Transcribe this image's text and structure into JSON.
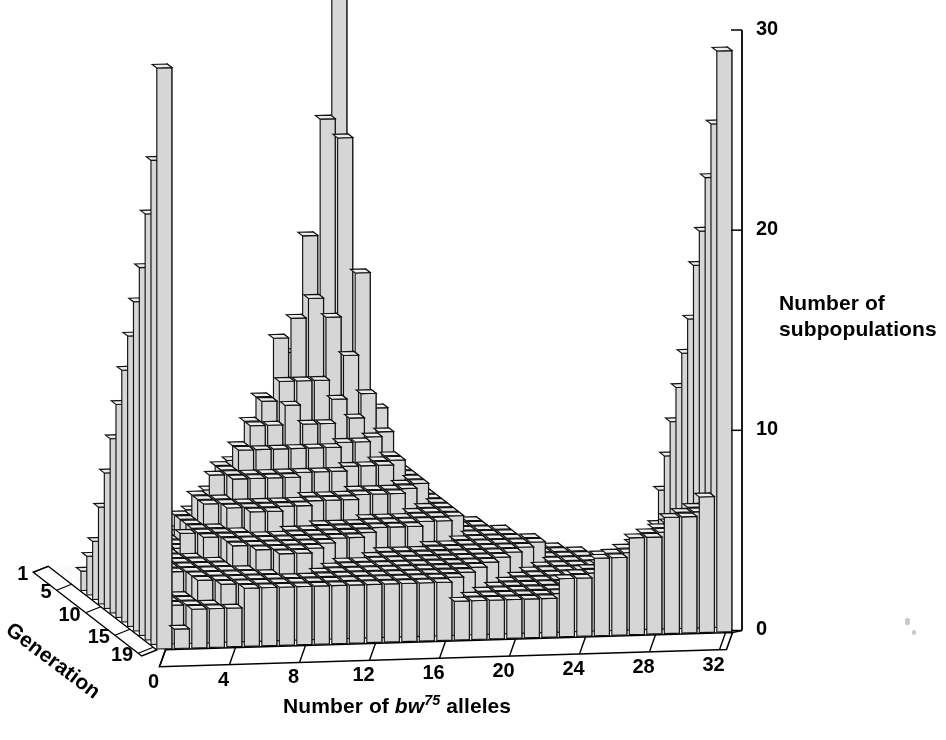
{
  "figure": {
    "background": "#ffffff",
    "bar_front_color": "#d6d6d6",
    "bar_side_color": "#2b2b2b",
    "bar_top_color": "#ededed",
    "bar_edge_color": "#111111",
    "axis_color": "#000000",
    "floor_color": "#fbfbfb"
  },
  "axes": {
    "x_title_prefix": "Number of ",
    "x_title_gene": "bw",
    "x_title_sup": "75",
    "x_title_suffix": " alleles",
    "x_ticks": [
      0,
      4,
      8,
      12,
      16,
      20,
      24,
      28,
      32
    ],
    "x_min": 0,
    "x_max": 32,
    "z_title_line1": "Number of",
    "z_title_line2": "subpopulations",
    "z_ticks": [
      0,
      10,
      20,
      30
    ],
    "z_min": 0,
    "z_max": 30,
    "depth_title": "Generation",
    "depth_ticks": [
      1,
      5,
      10,
      15,
      19
    ],
    "depth_min": 1,
    "depth_max": 19
  },
  "chart_data": {
    "type": "bar",
    "subtype": "3d-histogram",
    "title": "",
    "xlabel": "Number of bw75 alleles",
    "ylabel": "Generation",
    "zlabel": "Number of subpopulations",
    "xlim": [
      0,
      32
    ],
    "ylim": [
      1,
      19
    ],
    "zlim": [
      0,
      30
    ],
    "grid": false,
    "legend": "none",
    "x_categories": [
      0,
      1,
      2,
      3,
      4,
      5,
      6,
      7,
      8,
      9,
      10,
      11,
      12,
      13,
      14,
      15,
      16,
      17,
      18,
      19,
      20,
      21,
      22,
      23,
      24,
      25,
      26,
      27,
      28,
      29,
      30,
      31,
      32
    ],
    "y_categories": [
      1,
      2,
      3,
      4,
      5,
      6,
      7,
      8,
      9,
      10,
      11,
      12,
      13,
      14,
      15,
      16,
      17,
      18,
      19
    ],
    "note": "Counts of subpopulations (out of 107) having a given number of bw75 alleles, per generation of Buri's Drosophila drift experiment. Rows are generations 1-19 front-to-back order reversed; generation 1 is at the back.",
    "series": [
      {
        "generation": 1,
        "values": [
          0,
          0,
          0,
          0,
          0,
          0,
          0,
          0,
          0,
          0,
          0,
          0,
          0,
          0,
          0,
          0,
          107,
          0,
          0,
          0,
          0,
          0,
          0,
          0,
          0,
          0,
          0,
          0,
          0,
          0,
          0,
          0,
          0
        ]
      },
      {
        "generation": 2,
        "values": [
          0,
          0,
          0,
          0,
          0,
          0,
          0,
          0,
          0,
          0,
          0,
          1,
          5,
          11,
          17,
          23,
          22,
          15,
          8,
          3,
          2,
          0,
          0,
          0,
          0,
          0,
          0,
          0,
          0,
          0,
          0,
          0,
          0
        ]
      },
      {
        "generation": 3,
        "values": [
          0,
          0,
          0,
          0,
          0,
          0,
          0,
          0,
          1,
          3,
          6,
          9,
          12,
          13,
          14,
          13,
          11,
          9,
          7,
          5,
          3,
          1,
          0,
          0,
          0,
          0,
          0,
          0,
          0,
          0,
          0,
          0,
          0
        ]
      },
      {
        "generation": 4,
        "values": [
          0,
          0,
          0,
          0,
          0,
          0,
          1,
          2,
          4,
          6,
          8,
          9,
          10,
          10,
          10,
          9,
          8,
          7,
          6,
          5,
          4,
          3,
          2,
          1,
          1,
          0,
          0,
          0,
          0,
          0,
          0,
          0,
          0
        ]
      },
      {
        "generation": 5,
        "values": [
          0,
          0,
          0,
          0,
          1,
          2,
          3,
          4,
          6,
          7,
          8,
          8,
          9,
          8,
          8,
          7,
          7,
          6,
          6,
          5,
          4,
          3,
          2,
          2,
          1,
          1,
          0,
          0,
          0,
          0,
          0,
          0,
          0
        ]
      },
      {
        "generation": 6,
        "values": [
          1,
          0,
          1,
          1,
          2,
          3,
          4,
          5,
          6,
          7,
          7,
          7,
          7,
          7,
          7,
          6,
          6,
          6,
          5,
          5,
          4,
          3,
          3,
          2,
          2,
          1,
          1,
          0,
          0,
          0,
          0,
          0,
          1
        ]
      },
      {
        "generation": 7,
        "values": [
          2,
          1,
          1,
          2,
          3,
          4,
          5,
          6,
          6,
          6,
          6,
          6,
          6,
          6,
          6,
          5,
          5,
          5,
          5,
          4,
          4,
          3,
          3,
          2,
          2,
          2,
          1,
          1,
          1,
          0,
          0,
          1,
          2
        ]
      },
      {
        "generation": 8,
        "values": [
          3,
          1,
          2,
          2,
          3,
          4,
          5,
          5,
          6,
          6,
          6,
          6,
          5,
          5,
          5,
          5,
          5,
          5,
          4,
          4,
          4,
          3,
          3,
          3,
          2,
          2,
          2,
          1,
          1,
          1,
          1,
          1,
          3
        ]
      },
      {
        "generation": 9,
        "values": [
          5,
          2,
          2,
          3,
          3,
          4,
          5,
          5,
          5,
          5,
          5,
          5,
          5,
          5,
          5,
          4,
          4,
          4,
          4,
          4,
          4,
          3,
          3,
          3,
          2,
          2,
          2,
          2,
          1,
          1,
          1,
          2,
          5
        ]
      },
      {
        "generation": 10,
        "values": [
          7,
          2,
          2,
          3,
          3,
          4,
          4,
          5,
          5,
          5,
          5,
          5,
          4,
          4,
          4,
          4,
          4,
          4,
          4,
          4,
          3,
          3,
          3,
          3,
          3,
          2,
          2,
          2,
          2,
          2,
          2,
          2,
          7
        ]
      },
      {
        "generation": 11,
        "values": [
          9,
          2,
          3,
          3,
          4,
          4,
          4,
          4,
          5,
          5,
          4,
          4,
          4,
          4,
          4,
          4,
          4,
          4,
          3,
          3,
          3,
          3,
          3,
          3,
          3,
          2,
          2,
          2,
          2,
          2,
          2,
          3,
          9
        ]
      },
      {
        "generation": 12,
        "values": [
          11,
          2,
          3,
          3,
          3,
          4,
          4,
          4,
          4,
          4,
          4,
          4,
          4,
          4,
          4,
          3,
          3,
          3,
          3,
          3,
          3,
          3,
          3,
          3,
          2,
          2,
          2,
          2,
          2,
          2,
          3,
          3,
          11
        ]
      },
      {
        "generation": 13,
        "values": [
          13,
          2,
          3,
          3,
          3,
          3,
          4,
          4,
          4,
          4,
          4,
          4,
          4,
          4,
          3,
          3,
          3,
          3,
          3,
          3,
          3,
          3,
          3,
          2,
          2,
          2,
          2,
          2,
          2,
          3,
          3,
          4,
          13
        ]
      },
      {
        "generation": 14,
        "values": [
          15,
          2,
          3,
          3,
          3,
          3,
          4,
          4,
          4,
          4,
          4,
          4,
          3,
          3,
          3,
          3,
          3,
          3,
          3,
          3,
          3,
          3,
          2,
          2,
          2,
          2,
          2,
          2,
          3,
          3,
          4,
          4,
          15
        ]
      },
      {
        "generation": 15,
        "values": [
          17,
          2,
          3,
          3,
          3,
          3,
          3,
          4,
          4,
          4,
          4,
          3,
          3,
          3,
          3,
          3,
          3,
          3,
          3,
          3,
          3,
          2,
          2,
          2,
          2,
          2,
          2,
          3,
          3,
          4,
          4,
          5,
          18
        ]
      },
      {
        "generation": 16,
        "values": [
          19,
          2,
          2,
          3,
          3,
          3,
          3,
          3,
          4,
          4,
          3,
          3,
          3,
          3,
          3,
          3,
          3,
          3,
          3,
          3,
          2,
          2,
          2,
          2,
          2,
          2,
          3,
          3,
          4,
          4,
          5,
          5,
          20
        ]
      },
      {
        "generation": 17,
        "values": [
          22,
          2,
          2,
          3,
          3,
          3,
          3,
          3,
          3,
          3,
          3,
          3,
          3,
          3,
          3,
          3,
          3,
          3,
          3,
          2,
          2,
          2,
          2,
          2,
          2,
          3,
          3,
          4,
          4,
          5,
          5,
          6,
          23
        ]
      },
      {
        "generation": 18,
        "values": [
          25,
          2,
          2,
          2,
          3,
          3,
          3,
          3,
          3,
          3,
          3,
          3,
          3,
          3,
          3,
          3,
          3,
          3,
          2,
          2,
          2,
          2,
          2,
          2,
          3,
          3,
          4,
          4,
          5,
          5,
          6,
          6,
          26
        ]
      },
      {
        "generation": 19,
        "values": [
          30,
          1,
          2,
          2,
          2,
          3,
          3,
          3,
          3,
          3,
          3,
          3,
          3,
          3,
          3,
          3,
          3,
          2,
          2,
          2,
          2,
          2,
          2,
          3,
          3,
          4,
          4,
          5,
          5,
          6,
          6,
          7,
          30
        ]
      }
    ]
  },
  "rendering": {
    "geometry_note": "Isometric-style projection: x to the right with slight upward slope, depth axis toward lower-right-front, z vertical."
  }
}
